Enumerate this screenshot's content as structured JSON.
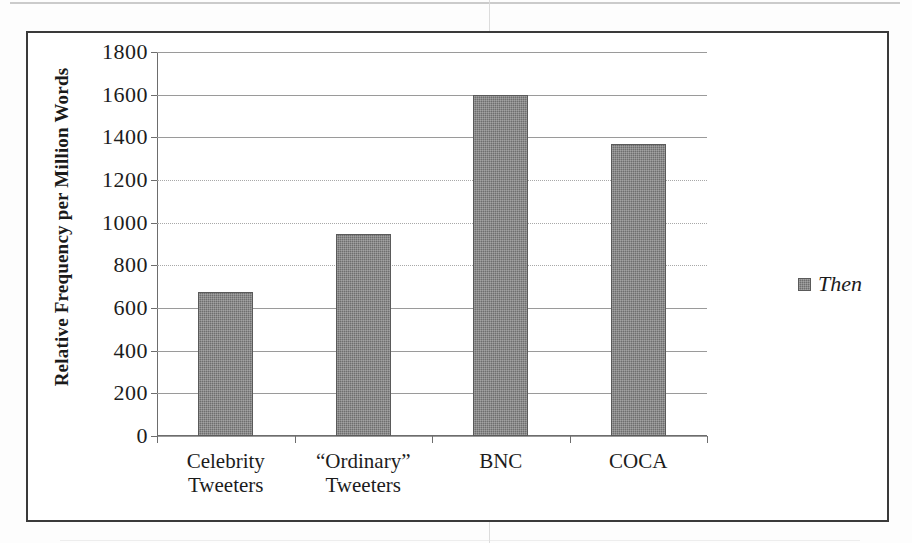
{
  "chart_data": {
    "type": "bar",
    "title": "",
    "xlabel": "",
    "ylabel": "Relative Frequency per Million Words",
    "categories": [
      "Celebrity\nTweeters",
      "“Ordinary”\nTweeters",
      "BNC",
      "COCA"
    ],
    "values": [
      675,
      945,
      1600,
      1368
    ],
    "series": [
      {
        "name": "Then",
        "values": [
          675,
          945,
          1600,
          1368
        ]
      }
    ],
    "ylim": [
      0,
      1800
    ],
    "ytick_step": 200,
    "ytick_labels": [
      "1800",
      "1600",
      "1400",
      "1200",
      "1000",
      "800",
      "600",
      "400",
      "200",
      "0"
    ],
    "ytick_values": [
      1800,
      1600,
      1400,
      1200,
      1000,
      800,
      600,
      400,
      200,
      0
    ],
    "grid": true,
    "legend_position": "right",
    "legend": [
      {
        "label": "Then",
        "color": "#6e6e6e"
      }
    ],
    "bar_color": "#6e6e6e",
    "frame_color": "#3a3a3a",
    "gridline_color": "#9a9a9a",
    "axis_color": "#6d6d6d",
    "text_color": "#1c1c1c"
  }
}
